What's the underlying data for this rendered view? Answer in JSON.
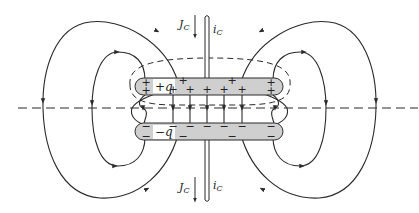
{
  "figure": {
    "colors": {
      "line": "#2a2a2a",
      "plate_fill": "#cfcfcf",
      "background": "#ffffff"
    }
  },
  "labels": {
    "top_plate_charge": "+q",
    "bottom_plate_charge": "−q",
    "current_density_top": "J",
    "current_density_top_sub": "C",
    "current_top": "i",
    "current_top_sub": "C",
    "current_density_bottom": "J",
    "current_density_bottom_sub": "C",
    "current_bottom": "i",
    "current_bottom_sub": "C"
  },
  "signs": {
    "plus": "+",
    "minus": "−"
  }
}
